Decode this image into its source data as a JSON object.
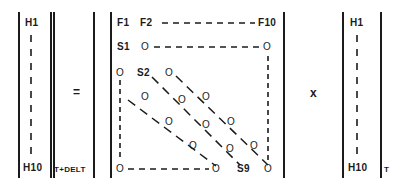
{
  "figure": {
    "kind": "matrix-equation-diagram",
    "equals_symbol": "=",
    "times_symbol": "x",
    "ink_color": "#1b1b1b",
    "background_color": "#ffffff"
  },
  "left_vector": {
    "name": "H-vector-new",
    "top_label": "H1",
    "bottom_label": "H10",
    "subscript": "T+DELT",
    "bracket_left_x": 18,
    "bracket_right_x": 50
  },
  "center_matrix": {
    "name": "transition-matrix",
    "top_row": {
      "first": "F1",
      "second": "F2",
      "last": "F10"
    },
    "second_row": {
      "label": "S1",
      "left_zero": "O",
      "right_zero": "O"
    },
    "third_row": {
      "left_zero": "O",
      "label": "S2",
      "zero": "O"
    },
    "bottom_row": {
      "left_zero": "O",
      "mid_zero": "O",
      "label": "S9",
      "right_zero": "O"
    },
    "zero_glyph": "O",
    "diagonal_zero_glyphs": [
      "O",
      "O",
      "O",
      "O",
      "O",
      "O",
      "O",
      "O",
      "O"
    ],
    "bracket_left_x": 110,
    "bracket_right_x": 283
  },
  "right_vector": {
    "name": "H-vector-old",
    "top_label": "H1",
    "bottom_label": "H10",
    "subscript": "T",
    "bracket_left_x": 342,
    "bracket_right_x": 380
  }
}
